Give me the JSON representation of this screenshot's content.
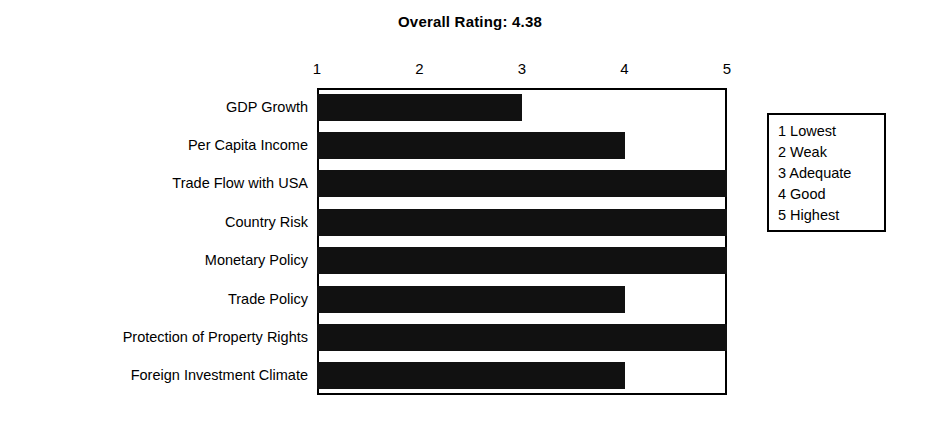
{
  "chart_data": {
    "type": "bar",
    "orientation": "horizontal",
    "title": "Overall Rating:  4.38",
    "xlabel": "",
    "ylabel": "",
    "xlim": [
      1,
      5
    ],
    "grid": false,
    "legend_position": "right",
    "categories": [
      "GDP Growth",
      "Per Capita Income",
      "Trade Flow with USA",
      "Country Risk",
      "Monetary Policy",
      "Trade Policy",
      "Protection of Property Rights",
      "Foreign Investment Climate"
    ],
    "values": [
      3,
      4,
      5,
      5,
      5,
      4,
      5,
      4
    ],
    "tick_labels": [
      "1",
      "2",
      "3",
      "4",
      "5"
    ],
    "tick_values": [
      1,
      2,
      3,
      4,
      5
    ],
    "legend_entries": [
      "1 Lowest",
      "2 Weak",
      "3 Adequate",
      "4 Good",
      "5 Highest"
    ],
    "overall_rating": "4.38",
    "colors": {
      "bar": "#111111",
      "axis": "#000000",
      "background": "#ffffff"
    }
  }
}
